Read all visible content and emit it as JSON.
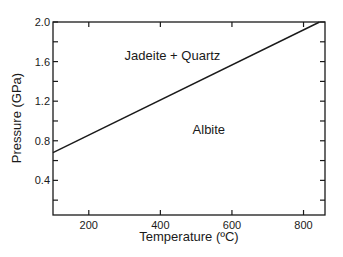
{
  "chart_data": {
    "type": "line",
    "title": "",
    "xlabel": "Temperature (ºC)",
    "ylabel": "Pressure (GPa)",
    "xlim": [
      100,
      860
    ],
    "ylim": [
      0.05,
      2.0
    ],
    "grid": false,
    "legend": null,
    "x_ticks": [
      200,
      400,
      600,
      800
    ],
    "x_tick_labels": [
      "200",
      "400",
      "600",
      "800"
    ],
    "y_ticks": [
      0.2,
      0.4,
      0.6,
      0.8,
      1.0,
      1.2,
      1.4,
      1.6,
      1.8,
      2.0
    ],
    "y_tick_labels": [
      "0.4",
      "0.8",
      "1.2",
      "1.6",
      "2.0"
    ],
    "y_labeled_ticks": [
      0.4,
      0.8,
      1.2,
      1.6,
      2.0
    ],
    "series": [
      {
        "name": "Albite = Jadeite + Quartz reaction boundary",
        "x": [
          100,
          845
        ],
        "y": [
          0.68,
          2.0
        ],
        "color": "#1a1a1a"
      }
    ],
    "annotations": [
      {
        "text": "Jadeite + Quartz",
        "x": 300,
        "y": 1.62
      },
      {
        "text": "Albite",
        "x": 490,
        "y": 0.87
      }
    ]
  },
  "colors": {
    "line": "#1a1a1a",
    "axis": "#1a1a1a",
    "background": "#ffffff"
  }
}
